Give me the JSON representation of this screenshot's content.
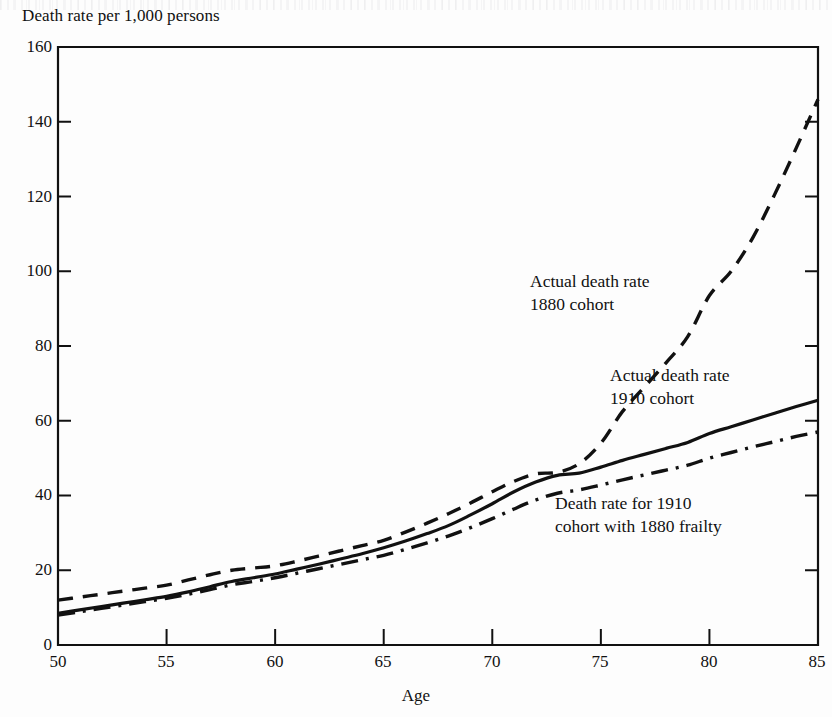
{
  "chart_data": {
    "type": "line",
    "title": "",
    "ylabel": "Death rate per 1,000 persons",
    "xlabel": "Age",
    "xlim": [
      50,
      85
    ],
    "ylim": [
      0,
      160
    ],
    "xticks": [
      50,
      55,
      60,
      65,
      70,
      75,
      80,
      85
    ],
    "yticks": [
      0,
      20,
      40,
      60,
      80,
      100,
      120,
      140,
      160
    ],
    "grid": false,
    "legend_position": "inline-annotations",
    "x": [
      50,
      51,
      52,
      53,
      54,
      55,
      56,
      57,
      58,
      59,
      60,
      61,
      62,
      63,
      64,
      65,
      66,
      67,
      68,
      69,
      70,
      71,
      72,
      73,
      74,
      75,
      76,
      77,
      78,
      79,
      80,
      81,
      82,
      83,
      84,
      85
    ],
    "series": [
      {
        "name": "Actual death rate 1880 cohort",
        "style": "dashed",
        "values": [
          12.0,
          12.8,
          13.6,
          14.4,
          15.2,
          16.0,
          17.4,
          18.8,
          20.0,
          20.6,
          21.2,
          22.4,
          23.8,
          25.2,
          26.6,
          28.0,
          30.2,
          32.6,
          35.2,
          38.0,
          41.0,
          43.8,
          45.8,
          46.2,
          48.5,
          54.0,
          62.5,
          69.0,
          75.5,
          82.5,
          93.5,
          100.0,
          109.0,
          120.5,
          133.0,
          146.0
        ]
      },
      {
        "name": "Actual death rate 1910 cohort",
        "style": "solid",
        "values": [
          8.5,
          9.4,
          10.3,
          11.2,
          12.1,
          13.0,
          14.2,
          15.6,
          17.0,
          18.0,
          19.0,
          20.3,
          21.6,
          23.0,
          24.4,
          26.0,
          27.8,
          29.8,
          32.0,
          34.8,
          37.8,
          41.0,
          43.6,
          45.4,
          46.0,
          47.6,
          49.4,
          51.0,
          52.6,
          54.2,
          56.6,
          58.4,
          60.2,
          62.0,
          63.8,
          65.5
        ]
      },
      {
        "name": "Death rate for 1910 cohort with 1880 frailty",
        "style": "dashdot",
        "values": [
          8.0,
          8.9,
          9.8,
          10.7,
          11.6,
          12.5,
          13.6,
          14.8,
          16.1,
          17.0,
          18.0,
          19.2,
          20.4,
          21.6,
          22.8,
          24.0,
          25.6,
          27.3,
          29.2,
          31.4,
          33.8,
          36.4,
          38.8,
          40.6,
          41.5,
          42.8,
          44.2,
          45.5,
          46.8,
          48.1,
          50.0,
          51.5,
          53.0,
          54.4,
          55.8,
          57.0
        ]
      }
    ],
    "annotations": [
      {
        "id": "ann-1880",
        "line1": "Actual death rate",
        "line2": "1880 cohort"
      },
      {
        "id": "ann-1910",
        "line1": "Actual death rate",
        "line2": "1910 cohort"
      },
      {
        "id": "ann-frailty",
        "line1": "Death rate for 1910",
        "line2": "cohort with 1880 frailty"
      }
    ]
  },
  "axis": {
    "y_title": "Death rate per 1,000 persons",
    "x_title": "Age",
    "y_ticks": [
      "0",
      "20",
      "40",
      "60",
      "80",
      "100",
      "120",
      "140",
      "160"
    ],
    "x_ticks": [
      "50",
      "55",
      "60",
      "65",
      "70",
      "75",
      "80",
      "85"
    ]
  },
  "colors": {
    "ink": "#111111",
    "paper": "#fdfdfd"
  }
}
